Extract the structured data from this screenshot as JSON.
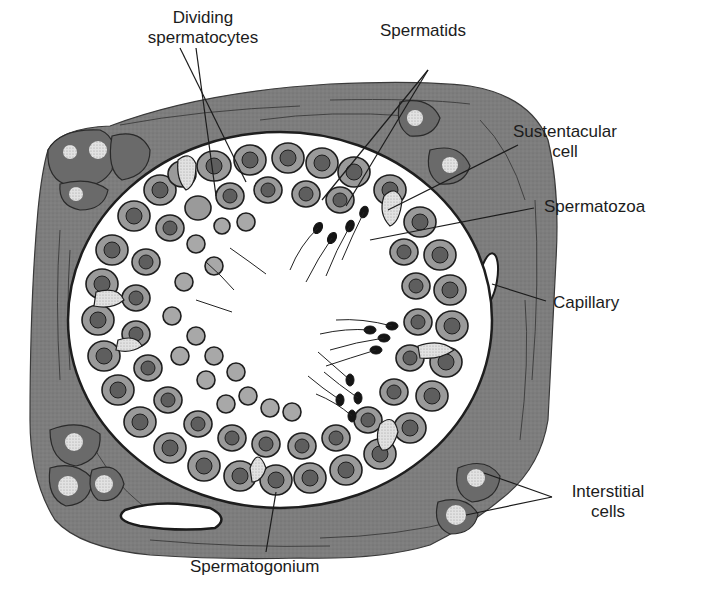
{
  "diagram": {
    "colors": {
      "background": "#ffffff",
      "connective_tissue": "#7d7d7d",
      "connective_tissue_dark": "#5e5e5e",
      "lumen": "#ffffff",
      "cell_fill": "#9a9a9a",
      "cell_light": "#b8b8b8",
      "nucleus": "#6a6a6a",
      "outline": "#1e1e1e",
      "label_text": "#1c1c1c"
    },
    "labels": [
      {
        "id": "dividing-spermatocytes",
        "lines": [
          "Dividing",
          "spermatocytes"
        ]
      },
      {
        "id": "spermatids",
        "lines": [
          "Spermatids"
        ]
      },
      {
        "id": "sustentacular-cell",
        "lines": [
          "Sustentacular",
          "cell"
        ]
      },
      {
        "id": "spermatozoa",
        "lines": [
          "Spermatozoa"
        ]
      },
      {
        "id": "capillary",
        "lines": [
          "Capillary"
        ]
      },
      {
        "id": "interstitial-cells",
        "lines": [
          "Interstitial",
          "cells"
        ]
      },
      {
        "id": "spermatogonium",
        "lines": [
          "Spermatogonium"
        ]
      }
    ]
  }
}
